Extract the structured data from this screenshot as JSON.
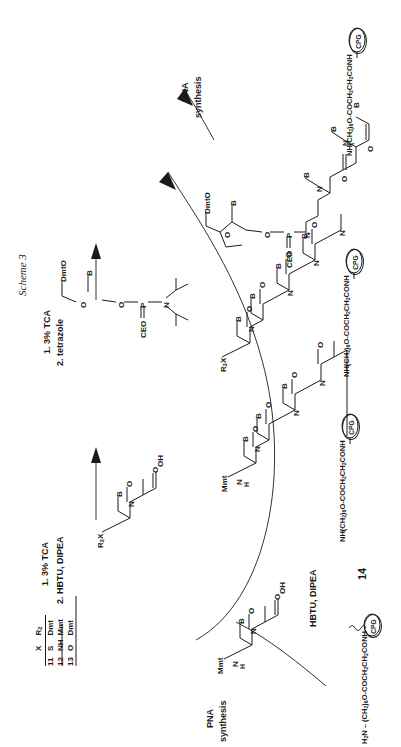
{
  "figure": {
    "scheme_label": "Scheme 3",
    "compound_number": "14"
  },
  "reagent_steps": {
    "dna_coupling": [
      "1. 3% TCA",
      "2. tetrazole"
    ],
    "pna_coupling": [
      "1. 3% TCA",
      "2. HBTU, DIPEA"
    ],
    "bottom_coupling": "HBTU, DIPEA"
  },
  "process_labels": {
    "dna_synthesis": [
      "DNA",
      "synthesis"
    ],
    "pna_synthesis": [
      "PNA",
      "synthesis"
    ]
  },
  "linker": {
    "chain": "NH(CH2)6O-COCH2CH2CONH",
    "chain_html": "NH(CH<sub>2</sub>)<sub>6</sub>O-COCH<sub>2</sub>CH<sub>2</sub>CONH",
    "support": "CPG"
  },
  "bottom_structure": {
    "amine_terminus": "H2N - (CH2)6O-COCH2CH2CONH",
    "amine_terminus_html": "H<sub>2</sub>N &#8211; (CH<sub>2</sub>)<sub>6</sub>O-COCH<sub>2</sub>CH<sub>2</sub>CONH",
    "support": "CPG"
  },
  "atom_labels": {
    "base": "B",
    "dmt_o": "DmtO",
    "ceo": "CEO",
    "phosphorus": "P",
    "oxygen": "O",
    "nitrogen": "N",
    "sulfur": "S",
    "hydroxyl": "OH",
    "mmt": "Mmt",
    "mmt_n": "Mmt",
    "nh": "N",
    "h": "H",
    "r2x": "R2X",
    "r2x_html": "R<sub>2</sub>X",
    "x": "X"
  },
  "table": {
    "headers": [
      "",
      "X",
      "R2"
    ],
    "headers_html": [
      "",
      "X",
      "R<sub>2</sub>"
    ],
    "rows": [
      {
        "num": "11",
        "x": "S",
        "r2": "Dmt"
      },
      {
        "num": "12",
        "x": "NH",
        "r2": "Mmt"
      },
      {
        "num": "13",
        "x": "O",
        "r2": "Dmt"
      }
    ]
  },
  "colors": {
    "ink": "#1b1b1b",
    "background": "#ffffff"
  }
}
